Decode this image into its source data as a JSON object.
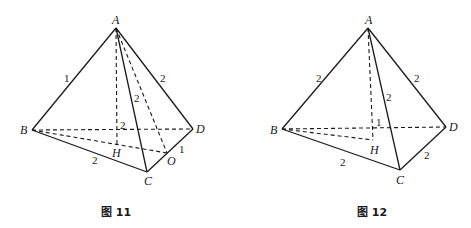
{
  "figures": [
    {
      "caption": "图 11",
      "vertices": {
        "A": "A",
        "B": "B",
        "C": "C",
        "D": "D",
        "H": "H",
        "O": "O"
      },
      "edge_labels": {
        "AB": "1",
        "AD": "2",
        "AC": "2",
        "AH": "2",
        "BC": "2",
        "OD": "1"
      }
    },
    {
      "caption": "图 12",
      "vertices": {
        "A": "A",
        "B": "B",
        "C": "C",
        "D": "D",
        "H": "H"
      },
      "edge_labels": {
        "AB": "2",
        "AD": "2",
        "AC": "2",
        "AH": "1",
        "BC": "2",
        "CD": "2"
      }
    }
  ]
}
